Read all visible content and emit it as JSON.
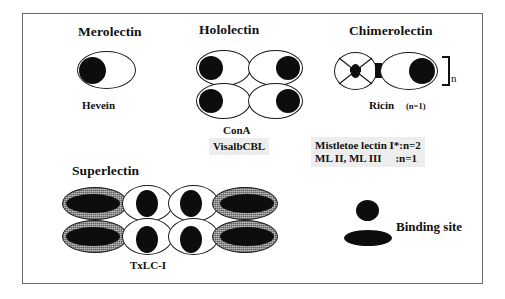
{
  "figure": {
    "border_color": "#6b6b6b",
    "background": "#ffffff"
  },
  "headings": {
    "merolectin": "Merolectin",
    "hololectin": "Hololectin",
    "chimerolectin": "Chimerolectin",
    "superlectin": "Superlectin"
  },
  "examples": {
    "merolectin": "Hevein",
    "hololectin_line1": "ConA",
    "hololectin_line2": "VisalbCBL",
    "chimerolectin": "Ricin",
    "chimerolectin_n": "(n=1)",
    "superlectin": "TxLC-I",
    "repeat_subscript": "n"
  },
  "mistletoe_note": {
    "line1": "Mistletoe lectin I*:n=2",
    "line2": "ML II, ML III     :n=1",
    "highlight_color": "#ededed"
  },
  "legend": {
    "label": "Binding site",
    "circle_icon": "binding-site-circle",
    "ellipse_icon": "binding-site-ellipse"
  },
  "colors": {
    "shape_fill_white": "#ffffff",
    "shape_fill_gray": "#bdbdbd",
    "blob_black": "#0d0d0d",
    "outline": "#1a1a1a",
    "text": "#111111"
  },
  "shape_counts": {
    "merolectin_domains": 1,
    "hololectin_domains": 4,
    "chimerolectin_domains": 2,
    "superlectin_domains": 8
  }
}
